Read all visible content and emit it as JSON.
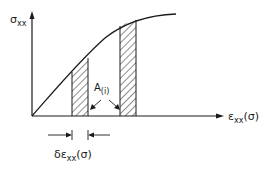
{
  "diagram": {
    "y_axis_label": {
      "symbol": "σ",
      "subscript": "xx"
    },
    "x_axis_label": {
      "symbol": "ε",
      "subscript": "xx",
      "suffix": "(σ)"
    },
    "strip_label": {
      "symbol": "A",
      "subscript": "(i)"
    },
    "width_label": {
      "prefix": "δε",
      "subscript": "xx",
      "suffix": "(σ)"
    },
    "colors": {
      "ink": "#1a1a1a",
      "background": "#ffffff"
    }
  }
}
